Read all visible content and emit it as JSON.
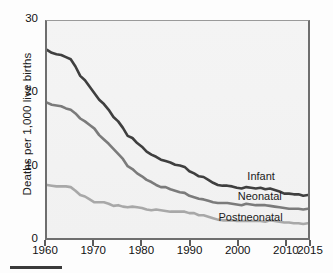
{
  "chart_data": {
    "type": "line",
    "title": "",
    "xlabel": "",
    "ylabel": "Deaths per 1,000 live births",
    "xlim": [
      1960,
      2015
    ],
    "ylim": [
      0,
      30
    ],
    "grid": false,
    "legend_position": "inline-right",
    "xticks": [
      1960,
      1970,
      1980,
      1990,
      2000,
      2010,
      2015
    ],
    "xtick_labels": [
      "1960",
      "1970",
      "1980",
      "1990",
      "2000",
      "2010",
      "2015"
    ],
    "yticks": [
      0,
      10,
      20,
      30
    ],
    "ytick_labels": [
      "0",
      "10",
      "20",
      "30"
    ],
    "x": [
      1960,
      1961,
      1962,
      1963,
      1964,
      1965,
      1966,
      1967,
      1968,
      1969,
      1970,
      1971,
      1972,
      1973,
      1974,
      1975,
      1976,
      1977,
      1978,
      1979,
      1980,
      1981,
      1982,
      1983,
      1984,
      1985,
      1986,
      1987,
      1988,
      1989,
      1990,
      1991,
      1992,
      1993,
      1994,
      1995,
      1996,
      1997,
      1998,
      1999,
      2000,
      2001,
      2002,
      2003,
      2004,
      2005,
      2006,
      2007,
      2008,
      2009,
      2010,
      2011,
      2012,
      2013,
      2014,
      2015
    ],
    "series": [
      {
        "name": "Infant",
        "color": "#3f3f3f",
        "label_x": 2002,
        "label_y": 8.6,
        "values": [
          26.0,
          25.6,
          25.4,
          25.3,
          25.0,
          24.7,
          23.7,
          22.4,
          21.8,
          20.9,
          20.0,
          19.1,
          18.5,
          17.7,
          16.7,
          16.1,
          15.2,
          14.1,
          13.8,
          13.1,
          12.6,
          11.9,
          11.5,
          11.2,
          10.8,
          10.6,
          10.4,
          10.1,
          10.0,
          9.8,
          9.2,
          8.9,
          8.5,
          8.4,
          8.0,
          7.6,
          7.3,
          7.2,
          7.2,
          7.1,
          6.9,
          6.8,
          7.0,
          6.9,
          6.8,
          6.9,
          6.7,
          6.8,
          6.6,
          6.4,
          6.1,
          6.1,
          6.0,
          6.0,
          5.8,
          5.9
        ]
      },
      {
        "name": "Neonatal",
        "color": "#7b7b7b",
        "label_x": 2000,
        "label_y": 5.8,
        "values": [
          18.7,
          18.4,
          18.3,
          18.2,
          17.9,
          17.7,
          17.2,
          16.5,
          16.1,
          15.6,
          15.1,
          14.2,
          13.6,
          13.0,
          12.3,
          11.6,
          10.9,
          9.9,
          9.5,
          8.9,
          8.5,
          8.0,
          7.7,
          7.3,
          7.0,
          7.0,
          6.7,
          6.5,
          6.3,
          6.2,
          5.8,
          5.6,
          5.4,
          5.3,
          5.1,
          4.9,
          4.8,
          4.8,
          4.8,
          4.7,
          4.6,
          4.5,
          4.7,
          4.6,
          4.5,
          4.5,
          4.5,
          4.4,
          4.3,
          4.2,
          4.1,
          4.0,
          4.0,
          4.0,
          3.9,
          4.0
        ]
      },
      {
        "name": "Postneonatal",
        "color": "#a8a8a8",
        "label_x": 1996,
        "label_y": 3.0,
        "values": [
          7.3,
          7.2,
          7.1,
          7.1,
          7.1,
          7.0,
          6.5,
          5.9,
          5.7,
          5.3,
          4.9,
          4.9,
          4.9,
          4.7,
          4.4,
          4.5,
          4.3,
          4.2,
          4.3,
          4.2,
          4.1,
          3.9,
          3.8,
          3.9,
          3.8,
          3.7,
          3.6,
          3.6,
          3.6,
          3.6,
          3.4,
          3.4,
          3.1,
          3.1,
          2.9,
          2.7,
          2.5,
          2.4,
          2.4,
          2.4,
          2.3,
          2.3,
          2.3,
          2.3,
          2.3,
          2.3,
          2.2,
          2.4,
          2.3,
          2.2,
          2.1,
          2.1,
          2.0,
          2.0,
          1.9,
          2.0
        ]
      }
    ]
  },
  "footer": {
    "rule": ""
  }
}
